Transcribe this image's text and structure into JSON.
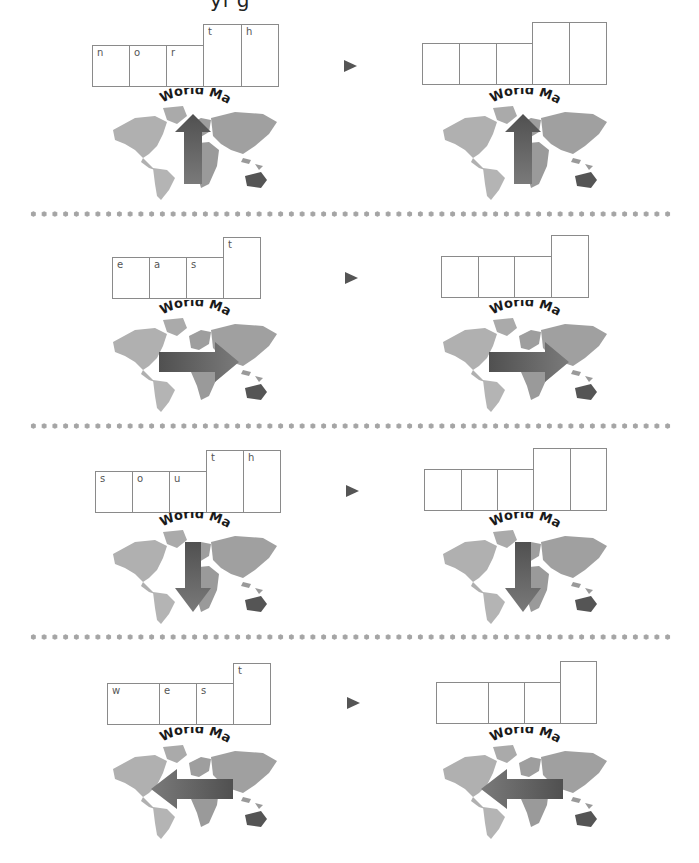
{
  "header": {
    "cut_off_title": "yi g"
  },
  "colors": {
    "box_border": "#8a8a8a",
    "letter": "#555555",
    "triangle": "#555555",
    "dots": "#a5a5a5",
    "land_light": "#b0b0b0",
    "land_mid": "#9a9a9a",
    "land_dark": "#7a7a7a",
    "arrow": "#606060"
  },
  "map_label": "World Map",
  "rows": [
    {
      "word": "north",
      "letters": [
        "n",
        "o",
        "r",
        "t",
        "h"
      ],
      "arrow_direction": "up"
    },
    {
      "word": "east",
      "letters": [
        "e",
        "a",
        "s",
        "t"
      ],
      "arrow_direction": "right"
    },
    {
      "word": "south",
      "letters": [
        "s",
        "o",
        "u",
        "t",
        "h"
      ],
      "arrow_direction": "down"
    },
    {
      "word": "west",
      "letters": [
        "w",
        "e",
        "s",
        "t"
      ],
      "arrow_direction": "left"
    }
  ],
  "icons": {
    "next": "triangle-right-icon"
  }
}
